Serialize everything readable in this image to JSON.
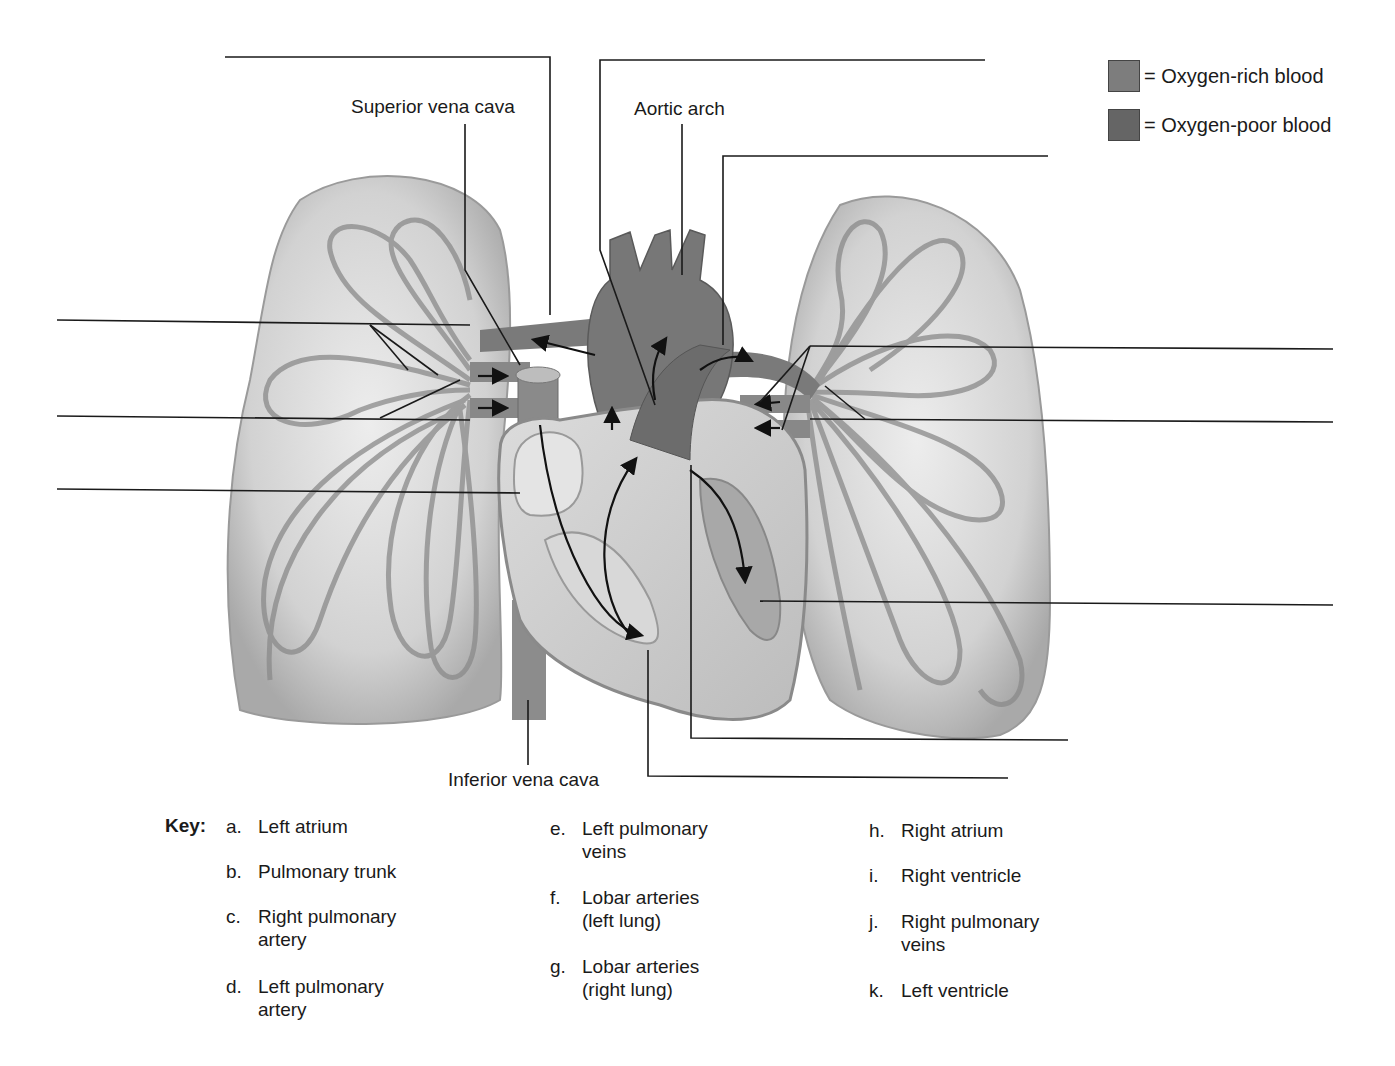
{
  "legend": {
    "items": [
      {
        "label": "= Oxygen-rich blood",
        "color": "#7d7d7d"
      },
      {
        "label": "= Oxygen-poor blood",
        "color": "#656565"
      }
    ]
  },
  "structure_labels": {
    "superior_vena_cava": "Superior vena cava",
    "aortic_arch": "Aortic arch",
    "inferior_vena_cava": "Inferior vena cava"
  },
  "blank_label_lines": {
    "count": 11
  },
  "key": {
    "title": "Key:",
    "items": [
      {
        "letter": "a.",
        "text": "Left atrium"
      },
      {
        "letter": "b.",
        "text": "Pulmonary trunk"
      },
      {
        "letter": "c.",
        "text": "Right pulmonary artery"
      },
      {
        "letter": "d.",
        "text": "Left pulmonary artery"
      },
      {
        "letter": "e.",
        "text": "Left pulmonary veins"
      },
      {
        "letter": "f.",
        "text": "Lobar arteries (left lung)"
      },
      {
        "letter": "g.",
        "text": "Lobar arteries (right lung)"
      },
      {
        "letter": "h.",
        "text": "Right atrium"
      },
      {
        "letter": "i.",
        "text": "Right ventricle"
      },
      {
        "letter": "j.",
        "text": "Right pulmonary veins"
      },
      {
        "letter": "k.",
        "text": "Left ventricle"
      }
    ]
  },
  "colors": {
    "lung_fill": "#d4d4d4",
    "lung_edge": "#9a9a9a",
    "vessel": "#8a8a8a",
    "heart_wall": "#c8c8c8",
    "heart_dark": "#6e6e6e",
    "leader_line": "#1a1a1a"
  }
}
